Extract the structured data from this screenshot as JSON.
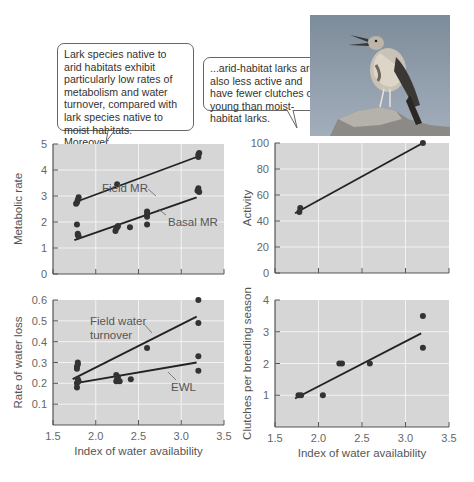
{
  "callouts": {
    "left": "Lark species native to arid habitats exhibit particularly low rates of metabolism and water turnover, compared with lark species native to moist habitats. Moreover...",
    "right": "...arid-habitat larks are also less active and have fewer clutches of young than moist-habitat larks."
  },
  "photo": {
    "subject": "lark perched on rock, singing",
    "sky_color": "#8a98a6"
  },
  "colors": {
    "plot_bg": "#d6d6d6",
    "grid": "#f2f2f2",
    "point": "#333333",
    "line": "#222222",
    "axis": "#555555"
  },
  "chart_data": [
    {
      "type": "scatter",
      "panel": "top-left",
      "title": "",
      "xlabel": "",
      "ylabel": "Metabolic rate",
      "xlim": [
        1.5,
        3.5
      ],
      "ylim": [
        0,
        5
      ],
      "xticks": [
        "1.5",
        "2.0",
        "2.5",
        "3.0",
        "3.5"
      ],
      "yticks": [
        "1",
        "2",
        "3",
        "4",
        "5"
      ],
      "grid": true,
      "series": [
        {
          "name": "Field MR",
          "label": "Field MR",
          "points": [
            [
              1.77,
              2.7
            ],
            [
              1.78,
              2.75
            ],
            [
              1.79,
              2.85
            ],
            [
              1.8,
              2.95
            ],
            [
              2.25,
              3.45
            ],
            [
              3.2,
              4.5
            ],
            [
              3.2,
              4.6
            ],
            [
              3.21,
              4.65
            ]
          ],
          "fit": [
            [
              1.75,
              2.75
            ],
            [
              3.18,
              4.5
            ]
          ]
        },
        {
          "name": "Basal MR",
          "label": "Basal MR",
          "points": [
            [
              1.78,
              1.9
            ],
            [
              1.79,
              1.55
            ],
            [
              1.8,
              1.45
            ],
            [
              1.79,
              1.5
            ],
            [
              2.23,
              1.65
            ],
            [
              2.24,
              1.75
            ],
            [
              2.25,
              1.8
            ],
            [
              2.26,
              1.85
            ],
            [
              2.4,
              1.8
            ],
            [
              2.6,
              1.9
            ],
            [
              2.6,
              2.2
            ],
            [
              2.6,
              2.3
            ],
            [
              2.6,
              2.4
            ],
            [
              3.19,
              3.2
            ],
            [
              3.2,
              3.3
            ],
            [
              3.21,
              3.15
            ]
          ],
          "fit": [
            [
              1.75,
              1.3
            ],
            [
              3.18,
              2.95
            ]
          ]
        }
      ]
    },
    {
      "type": "scatter",
      "panel": "top-right",
      "xlabel": "",
      "ylabel": "Activity",
      "xlim": [
        1.5,
        3.5
      ],
      "ylim": [
        0,
        100
      ],
      "xticks": [
        "1.5",
        "2.0",
        "2.5",
        "3.0",
        "3.5"
      ],
      "yticks": [
        "20",
        "40",
        "60",
        "80",
        "100"
      ],
      "grid": true,
      "series": [
        {
          "name": "Activity",
          "points": [
            [
              1.78,
              47
            ],
            [
              1.79,
              50
            ],
            [
              3.2,
              100
            ]
          ],
          "fit": [
            [
              1.73,
              46
            ],
            [
              3.2,
              100
            ]
          ]
        }
      ]
    },
    {
      "type": "scatter",
      "panel": "bottom-left",
      "xlabel": "Index of water availability",
      "ylabel": "Rate of water loss",
      "xlim": [
        1.5,
        3.5
      ],
      "ylim": [
        0,
        0.6
      ],
      "xticks": [
        "1.5",
        "2.0",
        "2.5",
        "3.0",
        "3.5"
      ],
      "yticks": [
        "0.1",
        "0.2",
        "0.3",
        "0.4",
        "0.5",
        "0.6"
      ],
      "grid": true,
      "series": [
        {
          "name": "Field water turnover",
          "label": "Field water\nturnover",
          "points": [
            [
              1.78,
              0.27
            ],
            [
              1.78,
              0.28
            ],
            [
              1.79,
              0.29
            ],
            [
              1.79,
              0.3
            ],
            [
              2.6,
              0.37
            ],
            [
              3.2,
              0.6
            ],
            [
              3.2,
              0.49
            ]
          ],
          "fit": [
            [
              1.73,
              0.22
            ],
            [
              3.18,
              0.52
            ]
          ]
        },
        {
          "name": "EWL",
          "label": "EWL",
          "points": [
            [
              1.78,
              0.18
            ],
            [
              1.78,
              0.2
            ],
            [
              1.79,
              0.22
            ],
            [
              1.8,
              0.21
            ],
            [
              2.24,
              0.21
            ],
            [
              2.25,
              0.22
            ],
            [
              2.26,
              0.23
            ],
            [
              2.24,
              0.24
            ],
            [
              2.28,
              0.21
            ],
            [
              2.41,
              0.22
            ],
            [
              3.2,
              0.33
            ],
            [
              3.2,
              0.26
            ]
          ],
          "fit": [
            [
              1.75,
              0.2
            ],
            [
              3.18,
              0.3
            ]
          ]
        }
      ]
    },
    {
      "type": "scatter",
      "panel": "bottom-right",
      "xlabel": "Index of water availability",
      "ylabel": "Clutches per breeding season",
      "xlim": [
        1.5,
        3.5
      ],
      "ylim": [
        0,
        4
      ],
      "xticks": [
        "1.5",
        "2.0",
        "2.5",
        "3.0",
        "3.5"
      ],
      "yticks": [
        "1",
        "2",
        "3",
        "4"
      ],
      "grid": true,
      "series": [
        {
          "name": "Clutches",
          "points": [
            [
              1.77,
              1.0
            ],
            [
              1.8,
              1.0
            ],
            [
              2.05,
              1.0
            ],
            [
              2.24,
              2.0
            ],
            [
              2.27,
              2.0
            ],
            [
              2.59,
              2.0
            ],
            [
              3.2,
              3.5
            ],
            [
              3.2,
              2.5
            ]
          ],
          "fit": [
            [
              1.73,
              0.9
            ],
            [
              3.18,
              2.95
            ]
          ]
        }
      ]
    }
  ]
}
